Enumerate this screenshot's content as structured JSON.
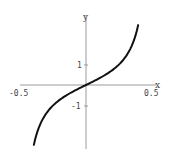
{
  "chart_data": {
    "type": "line",
    "title": "",
    "xlabel": "x",
    "ylabel": "y",
    "xlim": [
      -0.5,
      0.5
    ],
    "ylim": [
      -3.1,
      3.4
    ],
    "grid": false,
    "legend": null,
    "x_ticks": [
      "-0.5",
      "0.5"
    ],
    "y_ticks": [
      "1",
      "-1"
    ],
    "series": [
      {
        "name": "y = tan(pi x)",
        "x": [
          -0.395,
          -0.35,
          -0.3,
          -0.25,
          -0.2,
          -0.15,
          -0.1,
          -0.05,
          0,
          0.05,
          0.1,
          0.15,
          0.2,
          0.25,
          0.3,
          0.35,
          0.395
        ],
        "y": [
          -3.0,
          -1.96,
          -1.38,
          -1.0,
          -0.73,
          -0.51,
          -0.32,
          -0.16,
          0,
          0.16,
          0.32,
          0.51,
          0.73,
          1.0,
          1.38,
          1.96,
          3.0
        ]
      }
    ],
    "colors": {
      "axis": "#999999",
      "curve": "#111111",
      "text": "#444444"
    }
  },
  "labels": {
    "x_axis": "x",
    "y_axis": "y",
    "x_tick_neg": "-0.5",
    "x_tick_pos": "0.5",
    "y_tick_pos": "1",
    "y_tick_neg": "-1"
  }
}
